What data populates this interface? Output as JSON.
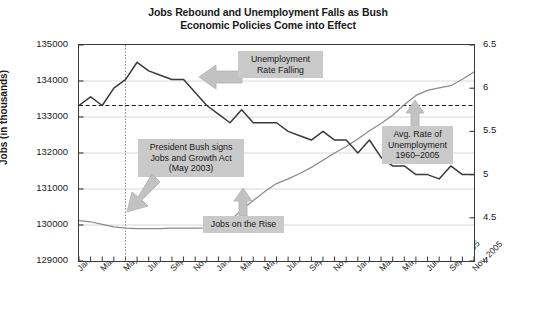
{
  "chart_data": {
    "type": "line",
    "title": "Jobs Rebound and Unemployment Falls as Bush Economic Policies Come into Effect",
    "title_line1": "Jobs Rebound and Unemployment Falls as Bush",
    "title_line2": "Economic Policies Come into Effect",
    "xlabel": "",
    "ylabel": "Jobs (in thousands)",
    "y2label": "Unemployment Rage (percent)",
    "ylim": [
      129000,
      135000
    ],
    "y2lim": [
      4,
      6.5
    ],
    "ytick_labels": [
      "135000",
      "134000",
      "133000",
      "132000",
      "131000",
      "130000",
      "129000"
    ],
    "ytick_values": [
      135000,
      134000,
      133000,
      132000,
      131000,
      130000,
      129000
    ],
    "y2tick_labels": [
      "6.5",
      "6",
      "5.5",
      "5",
      "4.5",
      "4"
    ],
    "y2tick_values": [
      6.5,
      6,
      5.5,
      5,
      4.5,
      4
    ],
    "grid": "horizontal-light",
    "legend": "none",
    "categories": [
      "Jan. 2003",
      "Feb. 2003",
      "Mar. 2003",
      "Apr. 2003",
      "May 2003",
      "Jun. 2003",
      "Jul. 2003",
      "Aug. 2003",
      "Sep. 2003",
      "Oct. 2003",
      "Nov. 2003",
      "Dec. 2003",
      "Jan. 2004",
      "Feb. 2004",
      "Mar. 2004",
      "Apr. 2004",
      "May 2004",
      "Jun. 2004",
      "Jul. 2004",
      "Aug. 2004",
      "Sep. 2004",
      "Oct. 2004",
      "Nov. 2004",
      "Dec. 2004",
      "Jan. 2005",
      "Feb. 2005",
      "Mar. 2005",
      "Apr. 2005",
      "May 2005",
      "Jun. 2005",
      "Jul. 2005",
      "Aug. 2005",
      "Sep. 2005",
      "Oct. 2005",
      "Nov. 2005"
    ],
    "xtick_labels": [
      "Jan. 2003",
      "Mar. 2003",
      "May 2003",
      "Jul. 2003",
      "Sep. 2003",
      "Nov. 2003",
      "Jan. 2004",
      "Mar. 2004",
      "May 2004",
      "Jul. 2004",
      "Sep. 2004",
      "Nov. 2004",
      "Jan. 2005",
      "Mar. 2005",
      "May 2005",
      "Jul. 2005",
      "Sep. 2005",
      "Nov. 2005"
    ],
    "series": [
      {
        "name": "Unemployment Rate",
        "axis": "right",
        "units": "percent",
        "color": "#3a3a3a",
        "values": [
          5.8,
          5.9,
          5.8,
          6.0,
          6.1,
          6.3,
          6.2,
          6.15,
          6.1,
          6.1,
          5.95,
          5.8,
          5.7,
          5.6,
          5.75,
          5.6,
          5.6,
          5.6,
          5.5,
          5.45,
          5.4,
          5.5,
          5.4,
          5.4,
          5.25,
          5.4,
          5.2,
          5.1,
          5.1,
          5.0,
          5.0,
          4.95,
          5.1,
          5.0,
          5.0
        ]
      },
      {
        "name": "Jobs",
        "axis": "left",
        "units": "thousands",
        "color": "#8a8a8a",
        "values": [
          130120,
          130090,
          130020,
          129950,
          129910,
          129900,
          129900,
          129900,
          129910,
          129910,
          129910,
          129920,
          129990,
          130120,
          130420,
          130680,
          130930,
          131150,
          131280,
          131430,
          131600,
          131800,
          132000,
          132180,
          132390,
          132620,
          132820,
          133050,
          133340,
          133600,
          133740,
          133810,
          133870,
          134050,
          134250
        ]
      }
    ],
    "reference_lines": [
      {
        "name": "avg-unemployment-1960-2005",
        "orientation": "horizontal",
        "axis": "right",
        "value": 5.8,
        "style": "dashed",
        "color": "#1a1a1a"
      },
      {
        "name": "jobs-and-growth-act-may-2003",
        "orientation": "vertical",
        "value": "May 2003",
        "style": "dotted",
        "color": "#7a7a7a"
      }
    ],
    "annotations": [
      {
        "name": "unemployment-rate-falling",
        "lines": [
          "Unemployment",
          "Rate Falling"
        ],
        "arrow": "left"
      },
      {
        "name": "president-bush-signs-jobs-and-growth-act",
        "lines": [
          "President Bush signs",
          "Jobs and Growth Act",
          "(May 2003)"
        ],
        "arrow": "down-left"
      },
      {
        "name": "jobs-on-the-rise",
        "lines": [
          "Jobs on the Rise"
        ],
        "arrow": "up"
      },
      {
        "name": "avg-rate-of-unemployment",
        "lines": [
          "Avg. Rate of",
          "Unemployment",
          "1960–2005"
        ],
        "arrow": "up"
      }
    ]
  }
}
